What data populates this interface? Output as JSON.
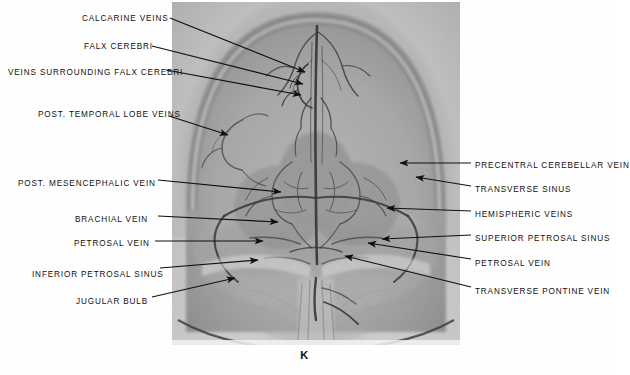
{
  "figure": {
    "caption": "K",
    "modality": "cerebral-angiogram",
    "view": "anteroposterior-venous-phase"
  },
  "labels_left": [
    {
      "text": "CALCARINE VEINS",
      "x": 82,
      "y": 14,
      "tail_x": 170,
      "tail_y": 18,
      "tip_x": 305,
      "tip_y": 72
    },
    {
      "text": "FALX CEREBRI",
      "x": 84,
      "y": 42,
      "tail_x": 152,
      "tail_y": 46,
      "tip_x": 303,
      "tip_y": 84
    },
    {
      "text": "VEINS SURROUNDING FALX CEREBRI",
      "x": 8,
      "y": 68,
      "tail_x": 166,
      "tail_y": 70,
      "tip_x": 301,
      "tip_y": 95
    },
    {
      "text": "POST.  TEMPORAL LOBE VEINS",
      "x": 38,
      "y": 110,
      "tail_x": 169,
      "tail_y": 116,
      "tip_x": 228,
      "tip_y": 135
    },
    {
      "text": "POST. MESENCEPHALIC VEIN",
      "x": 18,
      "y": 179,
      "tail_x": 158,
      "tail_y": 180,
      "tip_x": 281,
      "tip_y": 192
    },
    {
      "text": "BRACHIAL VEIN",
      "x": 75,
      "y": 215,
      "tail_x": 158,
      "tail_y": 216,
      "tip_x": 278,
      "tip_y": 222
    },
    {
      "text": "PETROSAL VEIN",
      "x": 74,
      "y": 239,
      "tail_x": 155,
      "tail_y": 241,
      "tip_x": 263,
      "tip_y": 241
    },
    {
      "text": "INFERIOR PETROSAL SINUS",
      "x": 32,
      "y": 270,
      "tail_x": 160,
      "tail_y": 268,
      "tip_x": 258,
      "tip_y": 260
    },
    {
      "text": "JUGULAR BULB",
      "x": 76,
      "y": 297,
      "tail_x": 152,
      "tail_y": 297,
      "tip_x": 235,
      "tip_y": 278
    }
  ],
  "labels_right": [
    {
      "text": "PRECENTRAL CEREBELLAR VEIN",
      "x": 475,
      "y": 161,
      "tail_x": 471,
      "tail_y": 163,
      "tip_x": 400,
      "tip_y": 163
    },
    {
      "text": "TRANSVERSE SINUS",
      "x": 475,
      "y": 185,
      "tail_x": 471,
      "tail_y": 186,
      "tip_x": 416,
      "tip_y": 177
    },
    {
      "text": "HEMISPHERIC VEINS",
      "x": 475,
      "y": 210,
      "tail_x": 471,
      "tail_y": 211,
      "tip_x": 387,
      "tip_y": 208
    },
    {
      "text": "SUPERIOR PETROSAL SINUS",
      "x": 475,
      "y": 234,
      "tail_x": 471,
      "tail_y": 235,
      "tip_x": 382,
      "tip_y": 239
    },
    {
      "text": "PETROSAL VEIN",
      "x": 475,
      "y": 259,
      "tail_x": 471,
      "tail_y": 259,
      "tip_x": 368,
      "tip_y": 243
    },
    {
      "text": "TRANSVERSE PONTINE VEIN",
      "x": 475,
      "y": 287,
      "tail_x": 471,
      "tail_y": 287,
      "tip_x": 345,
      "tip_y": 256
    }
  ],
  "colors": {
    "ink": "#101010",
    "page_background": "#ffffff",
    "film_light": "#e4e4e4",
    "film_mid": "#b9b9b9",
    "film_dark": "#6d6d6d",
    "vessel": "#3a3a3a"
  }
}
